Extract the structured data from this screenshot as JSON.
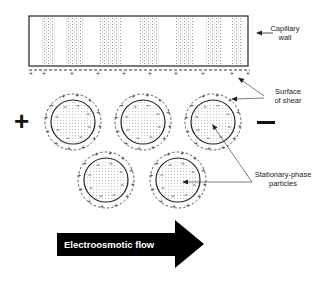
{
  "diagram": {
    "labels": {
      "capillary_wall": [
        "Capillary",
        "wall"
      ],
      "surface_of_shear": [
        "Surface",
        "of shear"
      ],
      "stationary_phase": [
        "Stationary-phase",
        "particles"
      ],
      "flow": "Electroosmotic flow"
    },
    "electrodes": {
      "anode": "+",
      "cathode": "−"
    },
    "wall": {
      "x": 29,
      "y": 16,
      "w": 219,
      "h": 50
    },
    "wall_charges": {
      "y": 76,
      "xs": [
        31,
        44,
        72,
        98,
        124,
        150,
        176,
        203,
        232,
        248
      ]
    },
    "particles": [
      {
        "cx": 73,
        "cy": 122
      },
      {
        "cx": 143,
        "cy": 122
      },
      {
        "cx": 213,
        "cy": 122
      },
      {
        "cx": 106,
        "cy": 180
      },
      {
        "cx": 178,
        "cy": 180
      }
    ],
    "particle_radius": 22,
    "shear_radius": 28,
    "colors": {
      "ink": "#111111",
      "stipple": "#9a9a9a",
      "arrow": "#000000"
    }
  }
}
